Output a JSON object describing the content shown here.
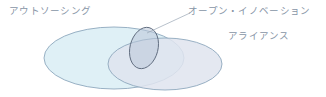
{
  "diagram": {
    "title": "",
    "background_color": "#ffffff",
    "type": "venn-diagram",
    "labels": {
      "outsourcing": "アウトソーシング",
      "open_innovation": "オープン・イノベーション",
      "alliance": "アライアンス"
    },
    "label_color": "#8795a6",
    "sets": [
      {
        "name": "outsourcing",
        "label": "アウトソーシング",
        "shape": "ellipse",
        "fill_color": "#dbeef5",
        "stroke_color": "#8fa8bd",
        "cx": 114,
        "cy": 58,
        "rx": 70,
        "ry": 31,
        "rotation": 0
      },
      {
        "name": "alliance",
        "label": "アライアンス",
        "shape": "ellipse",
        "fill_color": "#e6e9f1",
        "stroke_color": "#8fa8bd",
        "cx": 165,
        "cy": 64,
        "rx": 57,
        "ry": 26,
        "rotation": 0
      },
      {
        "name": "open_innovation",
        "label": "オープン・イノベーション",
        "shape": "ellipse",
        "fill_color": "#c3cddd",
        "stroke_color": "#5f6b7d",
        "cx": 144,
        "cy": 48,
        "rx": 14,
        "ry": 21,
        "rotation": 14
      }
    ],
    "leader_line": {
      "name": "open-innovation-leader-line",
      "color": "#9aa6b4",
      "x1": 147,
      "y1": 33,
      "x2": 190,
      "y2": 13
    }
  }
}
